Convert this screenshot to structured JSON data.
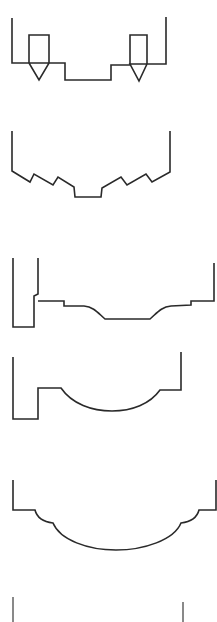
{
  "figure": {
    "stroke_color": "#2a2a2a",
    "thin_stroke_color": "#4a4a4a",
    "background": "#ffffff"
  },
  "profiles": [
    {
      "name": "profile-1-double-v-groove",
      "points": "12,18 12,63 29,63 29,35 49,35 49,63 29,63 39,80 49,63 65,63 65,80 111,80 111,65 130,65 130,35 147,35 147,64 130,64 139,81 147,64 166,64 166,17",
      "stroke_width": 1.6
    },
    {
      "name": "profile-2-zigzag",
      "points": "12,131 12,171 30,182 34,174 53,185 58,177 74,187 75,197 101,197 102,188 121,177 127,185 146,174 152,182 170,172 170,131",
      "stroke_width": 1.6
    },
    {
      "name": "profile-3-stepped-cove",
      "path": "M13,258 L13,327 L34,327 L34,296 L38,294 L38,258 M38,301 L64,301 L64,306 L84,306 C94,307 98,313 105,319 L150,319 C157,313 161,307 171,306 L191,305 L191,301 L214,301 L214,263",
      "stroke_width": 1.6
    },
    {
      "name": "profile-4-rebate-arc",
      "path": "M13,357 L13,419 L38,419 L38,388 L61,388 C72,404 92,411 112,411 C132,411 150,404 160,390 L181,390 L181,352",
      "stroke_width": 1.6
    },
    {
      "name": "profile-5-ogee-arc",
      "path": "M13,480 L13,510 L35,510 C37,518 45,522 53,523 C60,540 88,550 116,550 C144,550 174,540 181,523 C189,522 197,518 199,510 L216,510 L216,480",
      "stroke_width": 1.6
    },
    {
      "name": "profile-6-edge-lines",
      "lines": [
        {
          "x1": 13,
          "y1": 597,
          "x2": 13,
          "y2": 622
        },
        {
          "x1": 183,
          "y1": 602,
          "x2": 183,
          "y2": 622
        }
      ],
      "stroke_width": 1.3
    }
  ]
}
